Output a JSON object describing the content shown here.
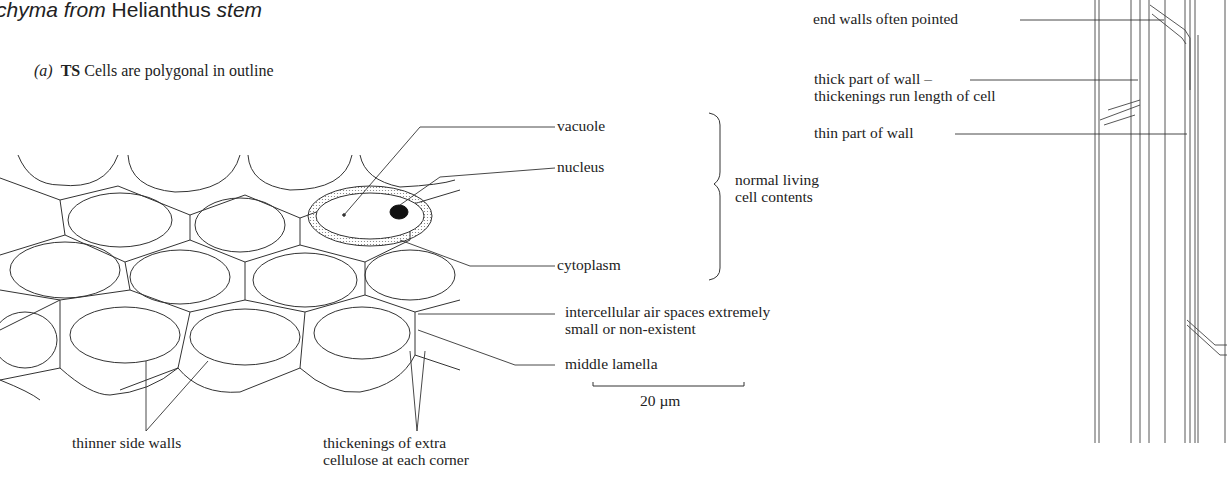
{
  "title": {
    "part1": "chyma from",
    "part2": "Helianthus",
    "part3": "stem"
  },
  "section_a": {
    "marker": "(a)",
    "bold": "TS",
    "caption": "Cells are polygonal in outline"
  },
  "labels_ts": {
    "vacuole": "vacuole",
    "nucleus": "nucleus",
    "cytoplasm": "cytoplasm",
    "brace_label_1": "normal living",
    "brace_label_2": "cell contents",
    "air_spaces_1": "intercellular air spaces extremely",
    "air_spaces_2": "small or non-existent",
    "middle_lamella": "middle lamella",
    "thinner_walls": "thinner side walls",
    "thickenings_1": "thickenings of extra",
    "thickenings_2": "cellulose at each corner"
  },
  "scale_bar": {
    "label": "20 µm"
  },
  "labels_ls": {
    "end_walls": "end walls often pointed",
    "thick_wall_1": "thick part of wall –",
    "thick_wall_2": "thickenings run length of cell",
    "thin_wall": "thin part of wall"
  }
}
